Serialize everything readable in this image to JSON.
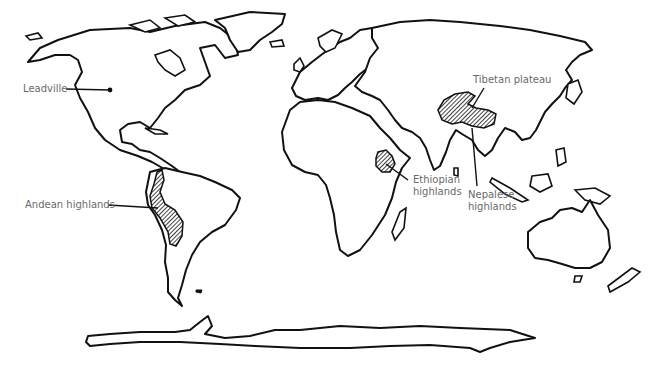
{
  "map": {
    "type": "world outline map",
    "background": "#ffffff",
    "line_color": "#111111",
    "label_color": "#6a6a6a",
    "regions": [
      {
        "id": "leadville",
        "label": "Leadville",
        "lines": [
          "Leadville"
        ],
        "marker": "point"
      },
      {
        "id": "andean",
        "label": "Andean highlands",
        "lines": [
          "Andean highlands"
        ],
        "marker": "hatched-area"
      },
      {
        "id": "ethiopian",
        "label": "Ethiopian highlands",
        "lines": [
          "Ethiopian",
          "highlands"
        ],
        "marker": "hatched-area"
      },
      {
        "id": "tibetan",
        "label": "Tibetan plateau",
        "lines": [
          "Tibetan plateau"
        ],
        "marker": "hatched-area"
      },
      {
        "id": "nepalese",
        "label": "Nepalese highlands",
        "lines": [
          "Nepalese",
          "highlands"
        ],
        "marker": "leader-line"
      }
    ]
  }
}
